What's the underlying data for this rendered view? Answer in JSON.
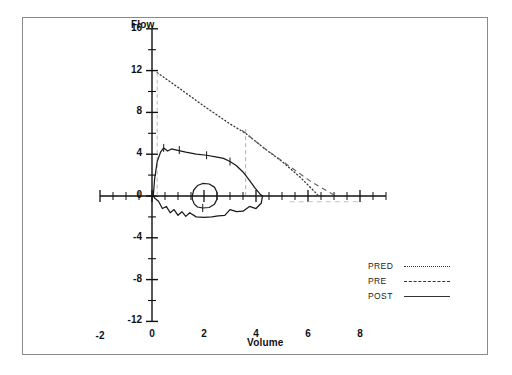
{
  "chart_data": {
    "type": "line",
    "title": "",
    "xlabel": "Volume",
    "ylabel": "Flow",
    "xlim": [
      -2,
      9
    ],
    "ylim": [
      -12,
      16
    ],
    "xticks": [
      -2,
      0,
      2,
      4,
      6,
      8
    ],
    "xtick_labels": [
      "-2",
      "0",
      "2",
      "4",
      "6",
      "8"
    ],
    "yticks": [
      -12,
      -8,
      -4,
      0,
      4,
      8,
      12,
      16
    ],
    "ytick_labels": [
      "-12",
      "-8",
      "-4",
      "0",
      "4",
      "8",
      "12",
      "16"
    ],
    "minor_tick_step": 0.5,
    "y_minor_tick_step": 2,
    "grid": false,
    "legend_position": "bottom-right",
    "series": [
      {
        "name": "PRED",
        "style": "dotted",
        "color": "#333333",
        "points": [
          [
            0.2,
            11.8
          ],
          [
            1.0,
            10.4
          ],
          [
            2.0,
            8.6
          ],
          [
            3.0,
            6.9
          ],
          [
            3.6,
            6.0
          ],
          [
            4.3,
            4.6
          ],
          [
            5.0,
            3.3
          ],
          [
            5.7,
            1.8
          ],
          [
            6.3,
            0.3
          ],
          [
            6.4,
            0.0
          ]
        ]
      },
      {
        "name": "PRE",
        "style": "dashed",
        "color": "#555555",
        "points": [
          [
            0.2,
            11.8
          ],
          [
            0.2,
            0.0
          ],
          [
            3.6,
            6.0
          ],
          [
            4.3,
            4.6
          ],
          [
            5.2,
            3.0
          ],
          [
            6.1,
            1.4
          ],
          [
            7.0,
            0.1
          ],
          [
            7.1,
            0.0
          ],
          [
            3.6,
            0.0
          ]
        ]
      },
      {
        "name": "POST",
        "style": "solid",
        "color": "#1a1a1a",
        "peak_flow": 4.6,
        "peak_flow_volume": 0.45,
        "fvc": 4.3,
        "inspiratory_peak_flow": -2.0,
        "points_expiratory": [
          [
            0.05,
            0.0
          ],
          [
            0.1,
            1.6
          ],
          [
            0.2,
            3.3
          ],
          [
            0.33,
            4.2
          ],
          [
            0.45,
            4.6
          ],
          [
            0.6,
            4.3
          ],
          [
            0.75,
            4.5
          ],
          [
            0.95,
            4.4
          ],
          [
            1.3,
            4.2
          ],
          [
            1.7,
            4.0
          ],
          [
            2.1,
            3.9
          ],
          [
            2.45,
            3.75
          ],
          [
            2.75,
            3.6
          ],
          [
            3.0,
            3.3
          ],
          [
            3.25,
            2.9
          ],
          [
            3.5,
            2.3
          ],
          [
            3.75,
            1.5
          ],
          [
            3.95,
            0.8
          ],
          [
            4.15,
            0.2
          ],
          [
            4.25,
            0.0
          ]
        ],
        "points_inspiratory": [
          [
            4.25,
            0.0
          ],
          [
            4.2,
            -0.7
          ],
          [
            4.0,
            -1.2
          ],
          [
            3.75,
            -1.0
          ],
          [
            3.5,
            -1.45
          ],
          [
            3.25,
            -1.5
          ],
          [
            3.0,
            -1.3
          ],
          [
            2.8,
            -1.85
          ],
          [
            2.55,
            -1.9
          ],
          [
            2.3,
            -2.0
          ],
          [
            2.0,
            -2.05
          ],
          [
            1.7,
            -2.0
          ],
          [
            1.45,
            -1.6
          ],
          [
            1.3,
            -1.95
          ],
          [
            1.15,
            -1.5
          ],
          [
            1.0,
            -1.85
          ],
          [
            0.85,
            -1.3
          ],
          [
            0.7,
            -1.6
          ],
          [
            0.55,
            -1.0
          ],
          [
            0.4,
            -1.2
          ],
          [
            0.25,
            -0.5
          ],
          [
            0.1,
            -0.2
          ],
          [
            0.05,
            0.0
          ]
        ],
        "tidal_loop": [
          [
            1.55,
            0.0
          ],
          [
            1.6,
            0.55
          ],
          [
            1.75,
            1.0
          ],
          [
            1.95,
            1.2
          ],
          [
            2.2,
            1.15
          ],
          [
            2.4,
            0.85
          ],
          [
            2.5,
            0.35
          ],
          [
            2.5,
            -0.3
          ],
          [
            2.4,
            -0.8
          ],
          [
            2.2,
            -1.1
          ],
          [
            1.95,
            -1.15
          ],
          [
            1.75,
            -1.05
          ],
          [
            1.62,
            -0.75
          ],
          [
            1.55,
            -0.3
          ],
          [
            1.55,
            0.0
          ]
        ]
      }
    ]
  },
  "axes": {
    "flow_label": "Flow",
    "volume_label": "Volume"
  },
  "legend": {
    "entries": [
      {
        "label": "PRED",
        "style": "dotted"
      },
      {
        "label": "PRE",
        "style": "dashed"
      },
      {
        "label": "POST",
        "style": "solid"
      }
    ]
  }
}
